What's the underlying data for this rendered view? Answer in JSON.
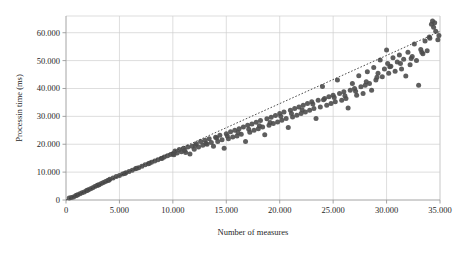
{
  "chart_data": {
    "type": "scatter",
    "title": "",
    "xlabel": "Number of measures",
    "ylabel": "Processin time (ms)",
    "xlim": [
      0,
      35000
    ],
    "ylim": [
      0,
      66000
    ],
    "grid": true,
    "legend": null,
    "point_color": "#4d4d4d",
    "grid_color": "#cfcfcf",
    "axis_color": "#9a9a9a",
    "trendline": {
      "type": "linear",
      "style": "dotted",
      "color": "#3a3a3a",
      "x": [
        0,
        35000
      ],
      "y": [
        0,
        60500
      ]
    },
    "xticks": [
      0,
      5000,
      10000,
      15000,
      20000,
      25000,
      30000,
      35000
    ],
    "xticklabels": [
      "0",
      "5.000",
      "10.000",
      "15.000",
      "20.000",
      "25.000",
      "30.000",
      "35.000"
    ],
    "yticks": [
      0,
      10000,
      20000,
      30000,
      40000,
      50000,
      60000
    ],
    "yticklabels": [
      "0",
      "10.000",
      "20.000",
      "30.000",
      "40.000",
      "50.000",
      "60.000"
    ],
    "points": [
      [
        300,
        700
      ],
      [
        500,
        900
      ],
      [
        700,
        1100
      ],
      [
        900,
        1500
      ],
      [
        1100,
        1900
      ],
      [
        1300,
        2200
      ],
      [
        1500,
        2600
      ],
      [
        1700,
        2900
      ],
      [
        1900,
        3300
      ],
      [
        2100,
        3700
      ],
      [
        2300,
        4000
      ],
      [
        2500,
        4400
      ],
      [
        2700,
        4800
      ],
      [
        2900,
        5200
      ],
      [
        3100,
        5500
      ],
      [
        3300,
        5900
      ],
      [
        3500,
        6300
      ],
      [
        3700,
        6600
      ],
      [
        3900,
        7000
      ],
      [
        4100,
        7400
      ],
      [
        4400,
        7900
      ],
      [
        4700,
        8400
      ],
      [
        5000,
        8800
      ],
      [
        5300,
        9300
      ],
      [
        5600,
        9800
      ],
      [
        5900,
        10200
      ],
      [
        6200,
        10700
      ],
      [
        6500,
        11200
      ],
      [
        6800,
        11600
      ],
      [
        7100,
        12100
      ],
      [
        7400,
        12600
      ],
      [
        7700,
        13000
      ],
      [
        8000,
        13500
      ],
      [
        8300,
        14000
      ],
      [
        8600,
        14400
      ],
      [
        8900,
        14900
      ],
      [
        9200,
        15400
      ],
      [
        9500,
        15900
      ],
      [
        9800,
        16300
      ],
      [
        10000,
        16600
      ],
      [
        10200,
        17600
      ],
      [
        10400,
        16900
      ],
      [
        10600,
        18100
      ],
      [
        10800,
        17300
      ],
      [
        11000,
        18600
      ],
      [
        11200,
        17000
      ],
      [
        11400,
        19000
      ],
      [
        11600,
        16500
      ],
      [
        11800,
        19300
      ],
      [
        12000,
        18200
      ],
      [
        12200,
        20200
      ],
      [
        12400,
        19000
      ],
      [
        12600,
        21000
      ],
      [
        12800,
        19600
      ],
      [
        13000,
        21400
      ],
      [
        13200,
        20000
      ],
      [
        13400,
        22000
      ],
      [
        13600,
        20600
      ],
      [
        13800,
        19300
      ],
      [
        14000,
        22500
      ],
      [
        14200,
        21000
      ],
      [
        14400,
        23200
      ],
      [
        14600,
        21600
      ],
      [
        14800,
        18600
      ],
      [
        15000,
        23800
      ],
      [
        15200,
        22000
      ],
      [
        15400,
        24500
      ],
      [
        15600,
        22600
      ],
      [
        15800,
        25000
      ],
      [
        16000,
        23000
      ],
      [
        16200,
        25600
      ],
      [
        16400,
        23600
      ],
      [
        16600,
        26200
      ],
      [
        16800,
        21000
      ],
      [
        17000,
        26800
      ],
      [
        17200,
        24300
      ],
      [
        17400,
        27300
      ],
      [
        17600,
        25000
      ],
      [
        17800,
        27900
      ],
      [
        18000,
        25600
      ],
      [
        18200,
        28500
      ],
      [
        18400,
        26200
      ],
      [
        18600,
        23400
      ],
      [
        18800,
        29100
      ],
      [
        19000,
        26800
      ],
      [
        19200,
        29700
      ],
      [
        19400,
        27400
      ],
      [
        19600,
        30300
      ],
      [
        19800,
        28000
      ],
      [
        20000,
        31000
      ],
      [
        20200,
        28600
      ],
      [
        20400,
        31600
      ],
      [
        20600,
        29200
      ],
      [
        20800,
        26000
      ],
      [
        21000,
        32200
      ],
      [
        21200,
        29800
      ],
      [
        21400,
        32800
      ],
      [
        21600,
        30400
      ],
      [
        21800,
        33400
      ],
      [
        22000,
        31000
      ],
      [
        22200,
        34000
      ],
      [
        22400,
        31600
      ],
      [
        22600,
        34600
      ],
      [
        22800,
        32200
      ],
      [
        23000,
        35200
      ],
      [
        23200,
        32800
      ],
      [
        23400,
        29200
      ],
      [
        23600,
        35800
      ],
      [
        23800,
        33400
      ],
      [
        24000,
        40700
      ],
      [
        24200,
        36400
      ],
      [
        24400,
        34000
      ],
      [
        24600,
        37000
      ],
      [
        24800,
        34600
      ],
      [
        25000,
        37600
      ],
      [
        25200,
        35200
      ],
      [
        25400,
        43000
      ],
      [
        25600,
        38200
      ],
      [
        25800,
        35800
      ],
      [
        26000,
        38800
      ],
      [
        26200,
        36400
      ],
      [
        26400,
        33000
      ],
      [
        26600,
        39400
      ],
      [
        26800,
        41800
      ],
      [
        27000,
        40000
      ],
      [
        27200,
        37600
      ],
      [
        27400,
        44600
      ],
      [
        27600,
        40600
      ],
      [
        27800,
        38200
      ],
      [
        28000,
        41200
      ],
      [
        28200,
        46000
      ],
      [
        28400,
        41800
      ],
      [
        28600,
        39400
      ],
      [
        28800,
        47500
      ],
      [
        29000,
        43000
      ],
      [
        29200,
        45500
      ],
      [
        29400,
        50200
      ],
      [
        29600,
        44200
      ],
      [
        29800,
        47000
      ],
      [
        30000,
        53800
      ],
      [
        30100,
        49000
      ],
      [
        30200,
        45500
      ],
      [
        30400,
        48000
      ],
      [
        30600,
        51000
      ],
      [
        30800,
        46200
      ],
      [
        31000,
        49500
      ],
      [
        31200,
        52000
      ],
      [
        31400,
        47000
      ],
      [
        31600,
        50500
      ],
      [
        31800,
        44500
      ],
      [
        32000,
        53000
      ],
      [
        32200,
        48500
      ],
      [
        32400,
        51500
      ],
      [
        32600,
        56000
      ],
      [
        32800,
        50000
      ],
      [
        33000,
        41200
      ],
      [
        33200,
        54000
      ],
      [
        33400,
        52500
      ],
      [
        33600,
        57000
      ],
      [
        33800,
        53500
      ],
      [
        34000,
        58500
      ],
      [
        34200,
        63000
      ],
      [
        34300,
        64200
      ],
      [
        34400,
        62000
      ],
      [
        34500,
        63600
      ],
      [
        34600,
        60500
      ],
      [
        34800,
        57500
      ],
      [
        34900,
        59000
      ],
      [
        1000,
        1700
      ],
      [
        2000,
        3500
      ],
      [
        3000,
        5400
      ],
      [
        4000,
        7100
      ],
      [
        5500,
        9500
      ],
      [
        6600,
        11400
      ],
      [
        7800,
        13200
      ],
      [
        9000,
        15000
      ],
      [
        10100,
        16200
      ],
      [
        11100,
        17800
      ],
      [
        12100,
        19600
      ],
      [
        13100,
        20400
      ],
      [
        14100,
        22200
      ],
      [
        15100,
        23000
      ],
      [
        16100,
        24200
      ],
      [
        17100,
        25400
      ],
      [
        18100,
        26600
      ],
      [
        19100,
        27800
      ],
      [
        20100,
        30000
      ],
      [
        21100,
        31000
      ],
      [
        22100,
        32400
      ],
      [
        23100,
        34400
      ],
      [
        24100,
        36000
      ],
      [
        25100,
        36800
      ],
      [
        26100,
        37400
      ],
      [
        27100,
        39000
      ],
      [
        28100,
        42400
      ],
      [
        29100,
        44000
      ],
      [
        30300,
        47800
      ],
      [
        31300,
        49000
      ],
      [
        32300,
        50800
      ],
      [
        33300,
        53000
      ],
      [
        34050,
        58000
      ]
    ]
  }
}
